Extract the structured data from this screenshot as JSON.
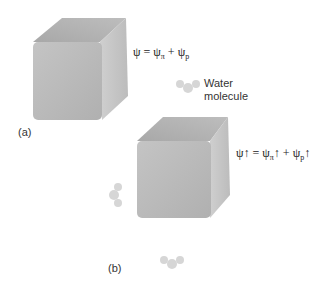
{
  "panel_a": {
    "label": "(a)",
    "equation": {
      "lhs": "ψ",
      "eq": " = ",
      "t1": "ψ",
      "t1_sub": "π",
      "plus": " + ",
      "t2": "ψ",
      "t2_sub": "p"
    }
  },
  "panel_b": {
    "label": "(b)",
    "molecule_label_line1": "Water",
    "molecule_label_line2": "molecule",
    "equation": {
      "lhs": "ψ↑",
      "eq": " = ",
      "t1": "ψ",
      "t1_sub": "π",
      "t1_arrow": "↑",
      "plus": " + ",
      "t2": "ψ",
      "t2_sub": "p",
      "t2_arrow": "↑"
    }
  },
  "colors": {
    "cube_front": "#b8b8b8",
    "cube_top": "#a9a9a9",
    "cube_side": "#c9c9c9",
    "molecule": "#d6d6d6",
    "arrow": "#222222"
  }
}
